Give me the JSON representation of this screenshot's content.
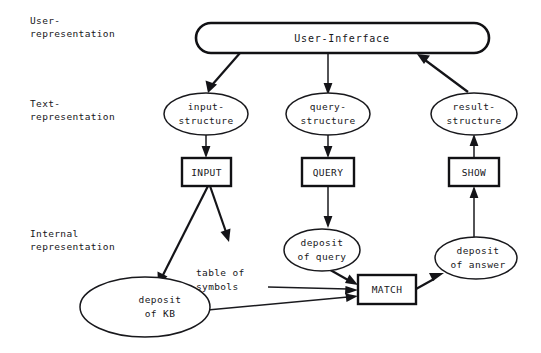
{
  "diagram": {
    "title": "User-Inferface",
    "background_color": "#ffffff",
    "ink_color": "#141418",
    "tier_labels": [
      {
        "id": "user",
        "line1": "User-",
        "line2": "representation"
      },
      {
        "id": "text",
        "line1": "Text-",
        "line2": "representation"
      },
      {
        "id": "internal",
        "line1": "Internal",
        "line2": "representation"
      }
    ],
    "nodes": {
      "user_interface": {
        "label": "User-Inferface",
        "shape": "rounded-rect"
      },
      "input_structure": {
        "line1": "input-",
        "line2": "structure",
        "shape": "ellipse"
      },
      "query_structure": {
        "line1": "query-",
        "line2": "structure",
        "shape": "ellipse"
      },
      "result_structure": {
        "line1": "result-",
        "line2": "structure",
        "shape": "ellipse"
      },
      "input_process": {
        "label": "INPUT",
        "shape": "rect"
      },
      "query_process": {
        "label": "QUERY",
        "shape": "rect"
      },
      "show_process": {
        "label": "SHOW",
        "shape": "rect"
      },
      "match_process": {
        "label": "MATCH",
        "shape": "rect"
      },
      "deposit_of_query": {
        "line1": "deposit",
        "line2": "of query",
        "shape": "ellipse"
      },
      "deposit_of_answer": {
        "line1": "deposit",
        "line2": "of answer",
        "shape": "ellipse"
      },
      "deposit_of_kb": {
        "line1": "deposit",
        "line2": "of KB",
        "shape": "ellipse"
      },
      "table_of_symbols": {
        "line1": "table of",
        "line2": "symbols",
        "shape": "plain-text"
      }
    },
    "edges": [
      {
        "from": "user_interface",
        "to": "input_structure",
        "style": "thick",
        "direction": "down-left"
      },
      {
        "from": "user_interface",
        "to": "query_structure",
        "style": "thin",
        "direction": "down"
      },
      {
        "from": "result_structure",
        "to": "user_interface",
        "style": "thick",
        "direction": "up-left"
      },
      {
        "from": "input_structure",
        "to": "input_process",
        "style": "thin",
        "direction": "down"
      },
      {
        "from": "query_structure",
        "to": "query_process",
        "style": "thin",
        "direction": "down"
      },
      {
        "from": "show_process",
        "to": "result_structure",
        "style": "thin",
        "direction": "up"
      },
      {
        "from": "input_process",
        "to": "deposit_of_kb",
        "style": "thick",
        "direction": "down-left"
      },
      {
        "from": "input_process",
        "to": "table_of_symbols",
        "style": "thick",
        "direction": "down-right"
      },
      {
        "from": "query_process",
        "to": "deposit_of_query",
        "style": "thin",
        "direction": "down"
      },
      {
        "from": "deposit_of_query",
        "to": "match_process",
        "style": "thick",
        "direction": "right"
      },
      {
        "from": "table_of_symbols",
        "to": "match_process",
        "style": "thin",
        "direction": "right"
      },
      {
        "from": "deposit_of_kb",
        "to": "match_process",
        "style": "thin",
        "direction": "right"
      },
      {
        "from": "match_process",
        "to": "deposit_of_answer",
        "style": "thick",
        "direction": "right"
      },
      {
        "from": "deposit_of_answer",
        "to": "show_process",
        "style": "thin",
        "direction": "up"
      }
    ]
  }
}
